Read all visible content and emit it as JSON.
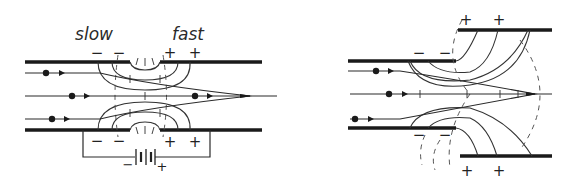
{
  "figure": {
    "left_panel": {
      "title": "Two-cylinder electrostatic lens (with battery)",
      "labels": {
        "slow": "slow",
        "fast": "fast"
      },
      "top_charges": [
        "−",
        "−",
        "+",
        "+"
      ],
      "bottom_charges": [
        "−",
        "−",
        "+",
        "+"
      ],
      "battery": {
        "minus": "−",
        "plus": "+"
      }
    },
    "right_panel": {
      "title": "Offset-electrode electrostatic lens",
      "top_charges_inner": [
        "−",
        "−"
      ],
      "top_charges_outer": [
        "+",
        "+"
      ],
      "bottom_charges_inner": [
        "−",
        "−"
      ],
      "bottom_charges_outer": [
        "+",
        "+"
      ]
    },
    "colors": {
      "ink": "#1a1a1a",
      "background": "#ffffff"
    }
  }
}
